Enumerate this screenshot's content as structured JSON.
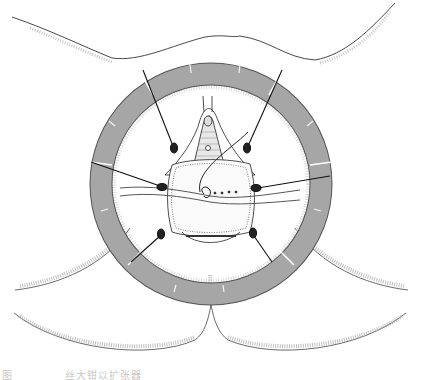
{
  "figure": {
    "type": "surgical-illustration",
    "ring": {
      "color": "#a6a6a6",
      "outline": "#555555",
      "segments": 6,
      "notches_per_segment": 1
    },
    "retraction_sutures": 6,
    "colors": {
      "line": "#2a2a2a",
      "stipple": "#9a9a9a",
      "background": "#ffffff"
    }
  },
  "caption": {
    "prefix": "图",
    "text": "丝大钳以扩张器"
  }
}
